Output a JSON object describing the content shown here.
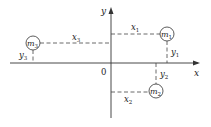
{
  "diagram": {
    "axes": {
      "x_label": "x",
      "y_label": "y",
      "origin_label": "0"
    },
    "masses": [
      {
        "name": "m",
        "sub": "1",
        "x_label": "x",
        "x_sub": "1",
        "y_label": "y",
        "y_sub": "1",
        "quadrant": "I"
      },
      {
        "name": "m",
        "sub": "2",
        "x_label": "x",
        "x_sub": "2",
        "y_label": "y",
        "y_sub": "2",
        "quadrant": "IV"
      },
      {
        "name": "m",
        "sub": "3",
        "x_label": "x",
        "x_sub": "3",
        "y_label": "y",
        "y_sub": "3",
        "quadrant": "II"
      }
    ]
  }
}
